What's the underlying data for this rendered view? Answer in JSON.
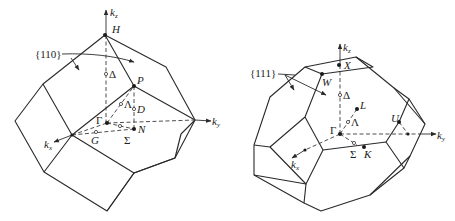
{
  "figures": [
    {
      "name": "bcc-brillouin-zone",
      "shape": "rhombic dodecahedron",
      "plane_label": "{110}",
      "axes": {
        "kz": "k",
        "kz_sub": "z",
        "ky": "k",
        "ky_sub": "y",
        "kx": "k",
        "kx_sub": "x"
      },
      "points": {
        "H": "H",
        "P": "P",
        "N": "N",
        "Gamma": "Γ"
      },
      "lines": {
        "Delta": "Δ",
        "Lambda": "Λ",
        "D": "D",
        "Sigma": "Σ",
        "G": "G"
      }
    },
    {
      "name": "fcc-brillouin-zone",
      "shape": "truncated octahedron",
      "plane_label": "{111}",
      "axes": {
        "kz": "k",
        "kz_sub": "z",
        "ky": "k",
        "ky_sub": "y",
        "kx": "k",
        "kx_sub": "x"
      },
      "points": {
        "X": "X",
        "W": "W",
        "L": "L",
        "U": "U",
        "K": "K",
        "Gamma": "Γ"
      },
      "lines": {
        "Delta": "Δ",
        "Lambda": "Λ",
        "Sigma": "Σ"
      }
    }
  ],
  "colors": {
    "line": "#2a2a2a",
    "background": "#ffffff"
  }
}
